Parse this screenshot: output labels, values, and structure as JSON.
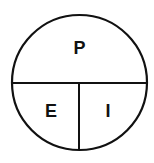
{
  "diagram": {
    "type": "divided-circle",
    "sections": [
      {
        "id": "top",
        "label": "P",
        "position": "upper-half"
      },
      {
        "id": "bottom-left",
        "label": "E",
        "position": "lower-left-quarter"
      },
      {
        "id": "bottom-right",
        "label": "I",
        "position": "lower-right-quarter"
      }
    ],
    "colors": {
      "stroke": "#111111",
      "fill": "#ffffff",
      "text": "#111111"
    }
  }
}
